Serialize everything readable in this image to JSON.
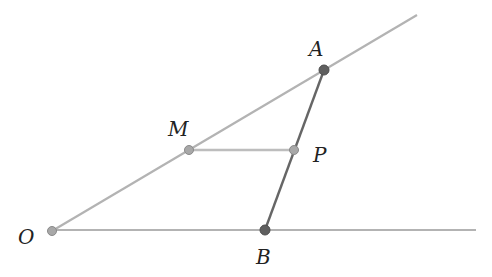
{
  "diagram": {
    "type": "geometry",
    "colors": {
      "ray": "#b3b3b3",
      "segment_ab": "#666666",
      "segment_mp": "#bdbdbd",
      "point_light": "#a8a8a8",
      "point_dark": "#5f5f5f",
      "point_stroke": "#8a8a8a",
      "label": "#222222"
    },
    "points": {
      "O": {
        "label": "O",
        "x": 52,
        "y": 231
      },
      "A": {
        "label": "A",
        "x": 324,
        "y": 70
      },
      "B": {
        "label": "B",
        "x": 265,
        "y": 230
      },
      "M": {
        "label": "M",
        "x": 189,
        "y": 150
      },
      "P": {
        "label": "P",
        "x": 294,
        "y": 150
      }
    },
    "labels": {
      "O": "O",
      "A": "A",
      "B": "B",
      "M": "M",
      "P": "P"
    },
    "rays": [
      {
        "from": "O",
        "through": "A",
        "end": [
          417,
          15
        ]
      },
      {
        "from": "O",
        "through": "B",
        "end": [
          476,
          230
        ]
      }
    ],
    "segments": [
      {
        "from": "A",
        "to": "B"
      },
      {
        "from": "M",
        "to": "P"
      }
    ]
  }
}
